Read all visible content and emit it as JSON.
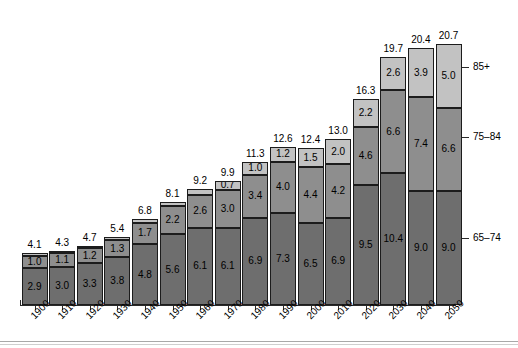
{
  "chart_data": {
    "type": "bar",
    "title": "",
    "subtitle": "",
    "xlabel": "",
    "ylabel": "",
    "ylim": [
      0,
      20.7
    ],
    "grid": false,
    "stacked": true,
    "legend_position": "right",
    "categories": [
      "1900",
      "1910",
      "1920",
      "1930",
      "1940",
      "1950",
      "1960",
      "1970",
      "1980",
      "1990",
      "2000",
      "2010",
      "2020",
      "2030",
      "2040",
      "2050"
    ],
    "series": [
      {
        "name": "65-74",
        "color": "#6e6e6e",
        "values": [
          2.9,
          3.0,
          3.3,
          3.8,
          4.8,
          5.6,
          6.1,
          6.1,
          6.9,
          7.3,
          6.5,
          6.9,
          9.5,
          10.4,
          9.0,
          9.0
        ]
      },
      {
        "name": "75-84",
        "color": "#8e8e8e",
        "values": [
          1.0,
          1.1,
          1.2,
          1.3,
          1.7,
          2.2,
          2.6,
          3.0,
          3.4,
          4.0,
          4.4,
          4.2,
          4.6,
          6.6,
          7.4,
          6.6
        ]
      },
      {
        "name": "85+",
        "color": "#c2c2c2",
        "values": [
          0.2,
          0.2,
          0.2,
          0.3,
          0.3,
          0.3,
          0.5,
          0.7,
          1.0,
          1.2,
          1.5,
          2.0,
          2.2,
          2.6,
          3.9,
          5.0
        ]
      }
    ],
    "segment_labels": {
      "65-74": [
        "2.9",
        "3.0",
        "3.3",
        "3.8",
        "4.8",
        "5.6",
        "6.1",
        "6.1",
        "6.9",
        "7.3",
        "6.5",
        "6.9",
        "9.5",
        "10.4",
        "9.0",
        "9.0"
      ],
      "75-84": [
        "1.0",
        "1.1",
        "1.2",
        "1.3",
        "1.7",
        "2.2",
        "2.6",
        "3.0",
        "3.4",
        "4.0",
        "4.4",
        "4.2",
        "4.6",
        "6.6",
        "7.4",
        "6.6"
      ],
      "85+": [
        "",
        "",
        "",
        "",
        "",
        "",
        "",
        "0.7",
        "1.0",
        "1.2",
        "1.5",
        "2.0",
        "2.2",
        "2.6",
        "3.9",
        "5.0"
      ]
    },
    "totals": [
      "4.1",
      "4.3",
      "4.7",
      "5.4",
      "6.8",
      "8.1",
      "9.2",
      "9.9",
      "11.3",
      "12.6",
      "12.4",
      "13.0",
      "16.3",
      "19.7",
      "20.4",
      "20.7"
    ],
    "legend": [
      {
        "label": "85+",
        "color": "#c2c2c2"
      },
      {
        "label": "75–84",
        "color": "#8e8e8e"
      },
      {
        "label": "65–74",
        "color": "#6e6e6e"
      }
    ]
  }
}
